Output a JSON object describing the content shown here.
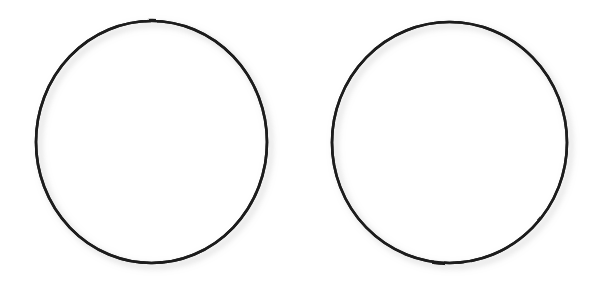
{
  "canvas": {
    "width": 606,
    "height": 285,
    "background_color": "#ffffff",
    "description": "Two empty hand-drawn circle outlines side by side on a white background"
  },
  "style": {
    "stroke_color": "#1c1c1c",
    "stroke_width": 2.6,
    "fill_color": "none",
    "shadow_color": "#b8b8b8"
  },
  "shapes": [
    {
      "name": "left-circle",
      "type": "circle",
      "label": "",
      "center_x": 151.5,
      "center_y": 142.0,
      "radius_x": 115.5,
      "radius_y": 121.0,
      "bounds": {
        "left": 36,
        "top": 21,
        "right": 267,
        "bottom": 263
      },
      "fill": "none",
      "stroke": "#1c1c1c"
    },
    {
      "name": "right-circle",
      "type": "circle",
      "label": "",
      "center_x": 449.5,
      "center_y": 142.5,
      "radius_x": 117.5,
      "radius_y": 120.5,
      "bounds": {
        "left": 332,
        "top": 22,
        "right": 567,
        "bottom": 263
      },
      "fill": "none",
      "stroke": "#1c1c1c"
    }
  ]
}
